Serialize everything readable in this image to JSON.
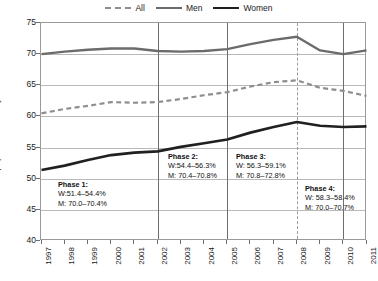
{
  "legend": {
    "position": "top-center",
    "items": [
      {
        "label": "All",
        "style": "dashed",
        "color": "#8e8e8e",
        "icon": "line-dashed-icon"
      },
      {
        "label": "Men",
        "style": "solid",
        "color": "#6b6b6b",
        "icon": "line-solid-icon"
      },
      {
        "label": "Women",
        "style": "solid",
        "color": "#202020",
        "icon": "line-solid-icon"
      }
    ]
  },
  "axes": {
    "ylabel": "% population 15–64 years",
    "yticks": [
      40,
      45,
      50,
      55,
      60,
      65,
      70,
      75
    ],
    "ylim": [
      40,
      75
    ],
    "xticks": [
      "1997",
      "1998",
      "1999",
      "2000",
      "2001",
      "2002",
      "2003",
      "2004",
      "2005",
      "2006",
      "2007",
      "2008",
      "2009",
      "2010",
      "2011"
    ]
  },
  "annotations": [
    {
      "name": "phase-1",
      "title": "Phase 1:",
      "women": "W:51.4–54.4%",
      "men": "M: 70.0–70.4%"
    },
    {
      "name": "phase-2",
      "title": "Phase 2:",
      "women": "W:54.4–56.3%",
      "men": "M: 70.4–70.8%"
    },
    {
      "name": "phase-3",
      "title": "Phase 3:",
      "women": "W: 56.3–59.1%",
      "men": "M: 70.8–72.8%"
    },
    {
      "name": "phase-4",
      "title": "Phase 4:",
      "women": "W: 58.3–58.4%",
      "men": "M: 70.0–70.7%"
    }
  ],
  "dividers": [
    {
      "year": "2002",
      "style": "solid"
    },
    {
      "year": "2005",
      "style": "solid"
    },
    {
      "year": "2008",
      "style": "dashed"
    },
    {
      "year": "2010",
      "style": "solid"
    }
  ],
  "chart_data": {
    "type": "line",
    "title": "",
    "xlabel": "",
    "ylabel": "% population 15–64 years",
    "ylim": [
      40,
      75
    ],
    "grid": true,
    "legend_position": "top-center",
    "x": [
      "1997",
      "1998",
      "1999",
      "2000",
      "2001",
      "2002",
      "2003",
      "2004",
      "2005",
      "2006",
      "2007",
      "2008",
      "2009",
      "2010",
      "2011"
    ],
    "series": [
      {
        "name": "All",
        "style": "dashed",
        "color": "#8e8e8e",
        "values": [
          60.5,
          61.2,
          61.7,
          62.3,
          62.2,
          62.3,
          62.8,
          63.4,
          63.9,
          64.8,
          65.5,
          65.8,
          64.6,
          64.1,
          63.3
        ]
      },
      {
        "name": "Men",
        "style": "solid",
        "color": "#6b6b6b",
        "values": [
          70.0,
          70.4,
          70.7,
          70.9,
          70.9,
          70.5,
          70.4,
          70.5,
          70.8,
          71.6,
          72.3,
          72.8,
          70.6,
          70.0,
          70.6
        ]
      },
      {
        "name": "Women",
        "style": "solid",
        "color": "#202020",
        "values": [
          51.4,
          52.1,
          53.0,
          53.8,
          54.2,
          54.4,
          55.1,
          55.7,
          56.3,
          57.4,
          58.3,
          59.1,
          58.5,
          58.3,
          58.4
        ]
      }
    ]
  }
}
